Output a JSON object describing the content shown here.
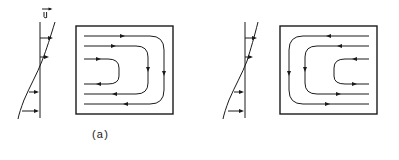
{
  "figure": {
    "kind": "fluid-flow-streamline-diagram",
    "background_color": "#ffffff",
    "line_color": "#1a1a1a",
    "panels": [
      {
        "id": "a",
        "caption": "(a)",
        "velocity_profile": {
          "label": "u",
          "label_has_vector_arrow": true,
          "reference_line": "vertical",
          "curve_shape": "S-curve / inflected shear profile",
          "arrow_count": 4,
          "arrow_direction": "right",
          "arrow_rows": [
            {
              "y_fraction": 0.18,
              "length": 13,
              "side": "right-of-axis"
            },
            {
              "y_fraction": 0.38,
              "length": 9,
              "side": "right-of-axis"
            },
            {
              "y_fraction": 0.72,
              "length": 10,
              "side": "left-of-axis"
            },
            {
              "y_fraction": 0.9,
              "length": 13,
              "side": "left-of-axis"
            }
          ]
        },
        "cavity": {
          "outline": "rectangle",
          "streamline_count": 3,
          "streamline_opening": "left",
          "rounded_end": "right",
          "top_flow_direction": "right",
          "bottom_flow_direction": "left",
          "right_flow_direction": "down"
        }
      },
      {
        "id": "b",
        "caption": "(b)",
        "velocity_profile": {
          "label": "",
          "label_has_vector_arrow": false,
          "reference_line": "vertical",
          "curve_shape": "S-curve / inflected shear profile (mirrored)",
          "arrow_count": 4,
          "arrow_direction": "right",
          "arrow_rows": [
            {
              "y_fraction": 0.18,
              "length": 12,
              "side": "right-of-axis"
            },
            {
              "y_fraction": 0.38,
              "length": 9,
              "side": "right-of-axis"
            },
            {
              "y_fraction": 0.72,
              "length": 10,
              "side": "left-of-axis"
            },
            {
              "y_fraction": 0.9,
              "length": 12,
              "side": "left-of-axis"
            }
          ]
        },
        "cavity": {
          "outline": "rectangle",
          "streamline_count": 3,
          "streamline_opening": "right",
          "rounded_end": "left",
          "top_flow_direction": "left",
          "bottom_flow_direction": "right",
          "left_flow_direction": "down"
        }
      }
    ]
  }
}
